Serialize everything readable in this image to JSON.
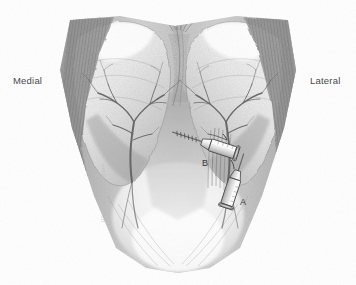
{
  "figure": {
    "medium": "pencil drawing",
    "background_color": "#ffffff",
    "ink_color": "#4a4a4a"
  },
  "orientation_labels": {
    "left": "Medial",
    "right": "Lateral"
  },
  "callouts": [
    {
      "id": "A",
      "label": "A",
      "description": "lower injection syringe, needle directed superiorly"
    },
    {
      "id": "B",
      "label": "B",
      "description": "upper injection syringe, needle directed medially"
    }
  ],
  "instruments": [
    {
      "name": "syringe-a",
      "letter": "A"
    },
    {
      "name": "syringe-b",
      "letter": "B"
    }
  ],
  "anatomy": {
    "lobes": [
      "left lobe",
      "right lobe"
    ],
    "features": [
      "midline cleft",
      "vascular branching tree left",
      "vascular branching tree right",
      "striated lateral margins"
    ]
  },
  "signature": {
    "text": "illustration signature"
  }
}
